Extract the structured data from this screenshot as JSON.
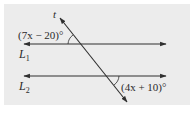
{
  "figure": {
    "background": "#ececec",
    "line_color": "#2f2f2f",
    "transversal_label": "t",
    "line1_label": "L",
    "line1_subscript": "1",
    "line2_label": "L",
    "line2_subscript": "2",
    "angle1_expr": "(7x − 20)°",
    "angle2_expr": "(4x + 10)°"
  }
}
